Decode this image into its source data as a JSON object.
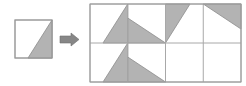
{
  "figure": {
    "canvas": {
      "width": 246,
      "height": 86,
      "background": "#ffffff"
    },
    "colors": {
      "fill_gray": "#b3b3b3",
      "stroke_gray": "#8c8c8c",
      "grid_line": "#a8a8a8",
      "tile_border": "#9a9a9a",
      "arrow_fill": "#878787",
      "arrow_stroke": "#6f6f6f",
      "white": "#ffffff"
    }
  },
  "source_tile": {
    "label": "source-tile",
    "x": 15,
    "y": 20,
    "width": 37,
    "height": 38,
    "triangle": {
      "name": "triangle-bottom-right",
      "points": "52,20 52,58 28,58"
    }
  },
  "arrow": {
    "label": "transform-arrow",
    "direction": "right",
    "x": 60,
    "y": 33,
    "width": 20,
    "height": 13,
    "points": "60,36 71,36 71,33 79,39.5 71,46 71,43 60,43"
  },
  "grid": {
    "label": "result-grid",
    "x": 90,
    "y": 4,
    "width": 151,
    "height": 78,
    "columns": 4,
    "rows": 2,
    "cell_width": 37.75,
    "cell_height": 39,
    "column_x": [
      90,
      127.75,
      165.5,
      203.25,
      241
    ],
    "row_y": [
      4,
      43,
      82
    ],
    "cells": [
      {
        "id": "cell-r1c1",
        "row": 1,
        "col": 1,
        "rotation_deg": 0,
        "triangle_points": "127.75,4 127.75,43 103,43"
      },
      {
        "id": "cell-r1c2",
        "row": 1,
        "col": 2,
        "rotation_deg": 90,
        "triangle_points": "127.75,18 165.5,43 127.75,43"
      },
      {
        "id": "cell-r1c3",
        "row": 1,
        "col": 3,
        "rotation_deg": 180,
        "triangle_points": "165.5,4 190,4 165.5,43"
      },
      {
        "id": "cell-r1c4",
        "row": 1,
        "col": 4,
        "rotation_deg": 270,
        "triangle_points": "203.25,4 241,4 241,29"
      },
      {
        "id": "cell-r2c1",
        "row": 2,
        "col": 1,
        "rotation_deg": 0,
        "triangle_points": "127.75,43 127.75,82 103,82"
      },
      {
        "id": "cell-r2c2",
        "row": 2,
        "col": 2,
        "rotation_deg": 90,
        "triangle_points": "127.75,57 165.5,82 127.75,82"
      },
      {
        "id": "cell-r2c3",
        "row": 2,
        "col": 3,
        "rotation_deg": null,
        "triangle_points": ""
      },
      {
        "id": "cell-r2c4",
        "row": 2,
        "col": 4,
        "rotation_deg": null,
        "triangle_points": ""
      }
    ]
  }
}
